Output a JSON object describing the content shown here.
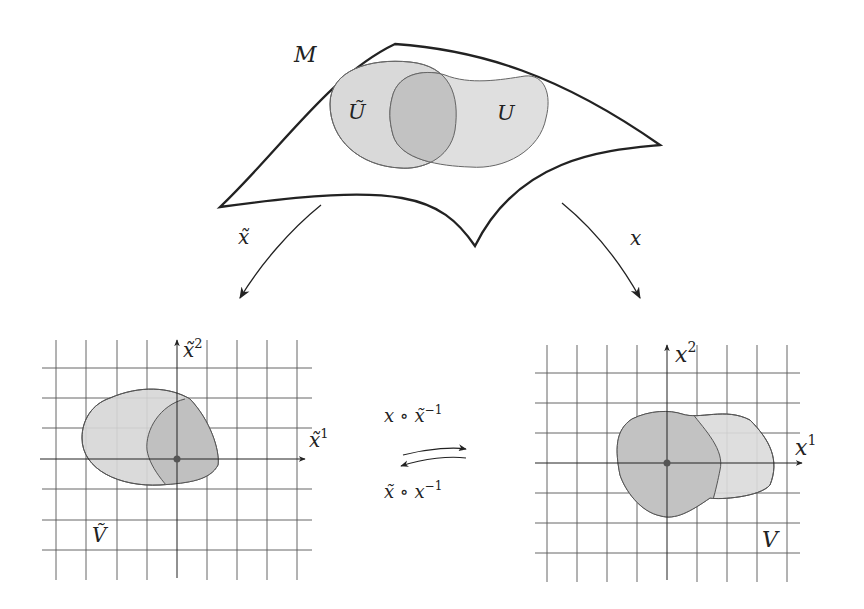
{
  "manifold": {
    "label": "M",
    "sets": [
      {
        "name": "U-tilde",
        "label": "Ũ"
      },
      {
        "name": "U",
        "label": "U"
      }
    ]
  },
  "maps": {
    "left": {
      "label": "x̃"
    },
    "right": {
      "label": "x"
    }
  },
  "left_chart": {
    "axis_x": {
      "base": "x̃",
      "sup": "1"
    },
    "axis_y": {
      "base": "x̃",
      "sup": "2"
    },
    "region_label": "Ṽ"
  },
  "right_chart": {
    "axis_x": {
      "base": "x",
      "sup": "1"
    },
    "axis_y": {
      "base": "x",
      "sup": "2"
    },
    "region_label": "V"
  },
  "transition_maps": {
    "forward": {
      "base": "x ∘ x̃",
      "sup": "−1"
    },
    "backward": {
      "base": "x̃ ∘ x",
      "sup": "−1"
    }
  },
  "colors": {
    "stroke": "#222222",
    "region_fill": "#d9d9d9",
    "overlap_fill": "#c4c4c4",
    "grid": "#444444",
    "point": "#555555"
  }
}
